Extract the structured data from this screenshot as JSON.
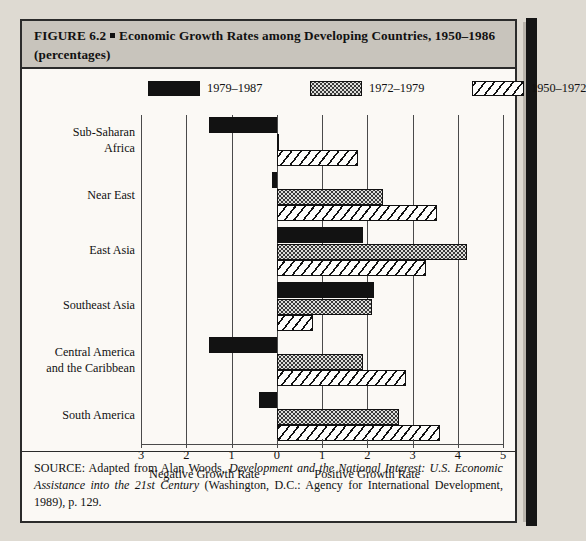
{
  "figure": {
    "title_prefix": "FIGURE 6.2",
    "title_main": "Economic Growth Rates among Developing Countries, 1950–1986 (percentages)"
  },
  "legend": {
    "items": [
      {
        "label": "1979–1987",
        "pattern": "solid-black",
        "color": "#121212"
      },
      {
        "label": "1972–1979",
        "pattern": "stippled-dots",
        "color": "#dededa"
      },
      {
        "label": "1950–1972",
        "pattern": "diagonal-hatch",
        "color": "#fdfdfb"
      }
    ]
  },
  "axis": {
    "tick_labels": [
      "3",
      "2",
      "1",
      "0",
      "1",
      "2",
      "3",
      "4",
      "5"
    ],
    "negative_title": "Negative Growth Rate",
    "positive_title": "Positive Growth Rate"
  },
  "source": {
    "prefix": "SOURCE: Adapted from Alan Woods, ",
    "italic_1": "Development and the National Interest: U.S. Economic Assistance into the 21st Century",
    "rest": " (Washington, D.C.: Agency for International Development, 1989), p. 129."
  },
  "chart_data": {
    "type": "bar",
    "orientation": "horizontal",
    "xlabel": "Growth Rate (percentages)",
    "ylabel": "",
    "xlim": [
      -3,
      5
    ],
    "xticks": [
      -3,
      -2,
      -1,
      0,
      1,
      2,
      3,
      4,
      5
    ],
    "xtick_labels": [
      "3",
      "2",
      "1",
      "0",
      "1",
      "2",
      "3",
      "4",
      "5"
    ],
    "grid": true,
    "legend_position": "top",
    "categories": [
      "Sub-Saharan Africa",
      "Near East",
      "East Asia",
      "Southeast Asia",
      "Central America and the Caribbean",
      "South America"
    ],
    "series": [
      {
        "name": "1979–1987",
        "pattern": "solid-black",
        "values": [
          -1.5,
          -0.1,
          1.9,
          2.15,
          -1.5,
          -0.4
        ]
      },
      {
        "name": "1972–1979",
        "pattern": "stippled-dots",
        "values": [
          0.05,
          2.35,
          4.2,
          2.1,
          1.9,
          2.7
        ]
      },
      {
        "name": "1950–1972",
        "pattern": "diagonal-hatch",
        "values": [
          1.8,
          3.55,
          3.3,
          0.8,
          2.85,
          3.6
        ]
      }
    ],
    "annotations": [
      "Negative Growth Rate",
      "Positive Growth Rate"
    ]
  }
}
